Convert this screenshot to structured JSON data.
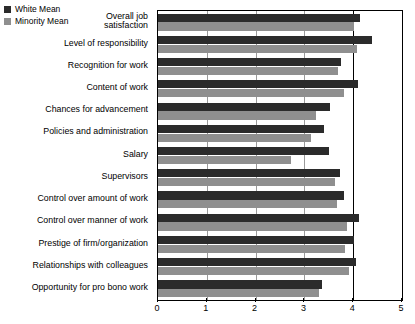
{
  "legend": {
    "items": [
      {
        "label": "White Mean",
        "color": "#2b2b2b",
        "key": "white_mean"
      },
      {
        "label": "Minority Mean",
        "color": "#8f8f8f",
        "key": "minority_mean"
      }
    ]
  },
  "chart_data": {
    "type": "bar",
    "orientation": "horizontal",
    "title": "",
    "subtitle": "",
    "xlabel": "",
    "ylabel": "",
    "xlim": [
      0,
      5
    ],
    "xticks": [
      "0",
      "1",
      "2",
      "3",
      "4",
      "5"
    ],
    "grid": true,
    "legend_position": "top-left",
    "categories": [
      "Overall job\nsatisfaction",
      "Level of responsibility",
      "Recognition for work",
      "Content of work",
      "Chances for advancement",
      "Policies and administration",
      "Salary",
      "Supervisors",
      "Control over amount of work",
      "Control over manner of work",
      "Prestige of firm/organization",
      "Relationships with colleagues",
      "Opportunity for pro bono work"
    ],
    "series": [
      {
        "name": "White Mean",
        "color": "#2b2b2b",
        "values": [
          4.13,
          4.38,
          3.76,
          4.09,
          3.53,
          3.4,
          3.5,
          3.72,
          3.82,
          4.12,
          4.01,
          4.06,
          3.36
        ]
      },
      {
        "name": "Minority Mean",
        "color": "#8f8f8f",
        "values": [
          4.01,
          4.07,
          3.68,
          3.81,
          3.24,
          3.14,
          2.73,
          3.62,
          3.66,
          3.88,
          3.83,
          3.92,
          3.3
        ]
      }
    ]
  }
}
